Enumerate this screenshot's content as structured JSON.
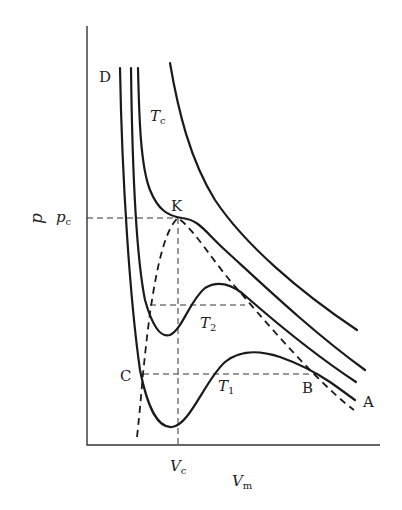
{
  "diagram": {
    "title": "",
    "axes": {
      "y_label": "p",
      "x_label": "V",
      "x_label_sub": "m",
      "y_tick": "p",
      "y_tick_sub": "c",
      "x_tick": "V",
      "x_tick_sub": "c"
    },
    "points": {
      "D": "D",
      "K": "K",
      "C": "C",
      "B": "B",
      "A": "A"
    },
    "isotherms": {
      "tc": {
        "label": "T",
        "sub": "c"
      },
      "t2": {
        "label": "T",
        "sub": "2"
      },
      "t1": {
        "label": "T",
        "sub": "1"
      }
    },
    "colors": {
      "line": "#1a1a1a",
      "background": "#ffffff"
    }
  }
}
